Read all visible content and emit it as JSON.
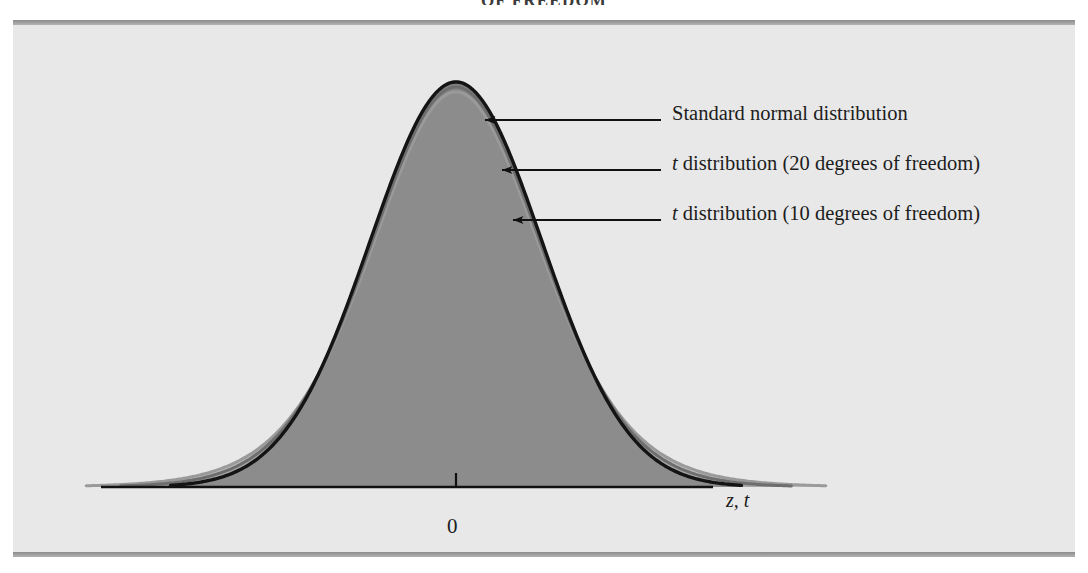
{
  "running_header": "OF FREEDOM",
  "figure": {
    "background_color": "#e8e8e8",
    "rule_color": "#9d9d9d"
  },
  "axis": {
    "origin_tick_label": "0",
    "variable_label": "z, t",
    "line_color": "#111111"
  },
  "annotations": [
    {
      "name": "standard-normal",
      "text": "Standard normal distribution",
      "italic_prefix": "",
      "rest": "Standard normal distribution"
    },
    {
      "name": "t-20",
      "text": "t distribution (20 degrees of freedom)",
      "italic_prefix": "t",
      "rest": " distribution (20 degrees of freedom)"
    },
    {
      "name": "t-10",
      "text": "t distribution (10 degrees of freedom)",
      "italic_prefix": "t",
      "rest": " distribution (10 degrees of freedom)"
    }
  ],
  "chart_data": {
    "type": "line",
    "title": "",
    "subtitle": "",
    "xlabel": "z, t",
    "ylabel": "",
    "xlim": [
      -4.6,
      4.6
    ],
    "ylim": [
      0,
      0.42
    ],
    "grid": false,
    "legend_position": "right-annotations",
    "xticks": [
      0
    ],
    "xticklabels": [
      "0"
    ],
    "yticks": [],
    "yticklabels": [],
    "shaded_region": {
      "under": "standard normal",
      "color": "#808080",
      "from": -3.3,
      "to": 3.3
    },
    "series": [
      {
        "name": "Standard normal distribution",
        "distribution": "normal",
        "df": null,
        "peak_density": 0.3989,
        "color": "#141414",
        "stroke_width": 3.4,
        "x": [
          -4.6,
          -4.0,
          -3.5,
          -3.0,
          -2.5,
          -2.0,
          -1.5,
          -1.0,
          -0.5,
          0.0,
          0.5,
          1.0,
          1.5,
          2.0,
          2.5,
          3.0,
          3.5,
          4.0,
          4.6
        ],
        "y": [
          0.0,
          0.0001,
          0.0009,
          0.0044,
          0.0175,
          0.054,
          0.1295,
          0.242,
          0.3521,
          0.3989,
          0.3521,
          0.242,
          0.1295,
          0.054,
          0.0175,
          0.0044,
          0.0009,
          0.0001,
          0.0
        ]
      },
      {
        "name": "t distribution (20 degrees of freedom)",
        "distribution": "student-t",
        "df": 20,
        "peak_density": 0.394,
        "color": "#6e6e6e",
        "stroke_width": 3.0,
        "x": [
          -4.6,
          -4.0,
          -3.5,
          -3.0,
          -2.5,
          -2.0,
          -1.5,
          -1.0,
          -0.5,
          0.0,
          0.5,
          1.0,
          1.5,
          2.0,
          2.5,
          3.0,
          3.5,
          4.0,
          4.6
        ],
        "y": [
          0.0004,
          0.0012,
          0.0029,
          0.0068,
          0.0165,
          0.0422,
          0.1104,
          0.236,
          0.3457,
          0.394,
          0.3457,
          0.236,
          0.1104,
          0.0422,
          0.0165,
          0.0068,
          0.0029,
          0.0012,
          0.0004
        ]
      },
      {
        "name": "t distribution (10 degrees of freedom)",
        "distribution": "student-t",
        "df": 10,
        "peak_density": 0.3891,
        "color": "#9a9a9a",
        "stroke_width": 3.0,
        "x": [
          -4.6,
          -4.0,
          -3.5,
          -3.0,
          -2.5,
          -2.0,
          -1.5,
          -1.0,
          -0.5,
          0.0,
          0.5,
          1.0,
          1.5,
          2.0,
          2.5,
          3.0,
          3.5,
          4.0,
          4.6
        ],
        "y": [
          0.0011,
          0.0027,
          0.0055,
          0.0114,
          0.0243,
          0.0611,
          0.1274,
          0.2304,
          0.3397,
          0.3891,
          0.3397,
          0.2304,
          0.1274,
          0.0611,
          0.0243,
          0.0114,
          0.0055,
          0.0027,
          0.0011
        ]
      }
    ],
    "annotation_arrows": [
      {
        "label": "Standard normal distribution",
        "target_x": -0.55,
        "points": "left"
      },
      {
        "label": "t distribution (20 degrees of freedom)",
        "target_x": -0.3,
        "points": "left"
      },
      {
        "label": "t distribution (10 degrees of freedom)",
        "target_x": -0.12,
        "points": "left"
      }
    ]
  }
}
